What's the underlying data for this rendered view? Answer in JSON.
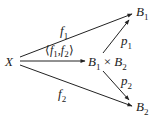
{
  "nodes": {
    "X": "X",
    "product": {
      "left": "B",
      "left_sub": "1",
      "op": "×",
      "right": "B",
      "right_sub": "2"
    },
    "B1": {
      "base": "B",
      "sub": "1"
    },
    "B2": {
      "base": "B",
      "sub": "2"
    }
  },
  "arrows": {
    "f1": {
      "base": "f",
      "sub": "1"
    },
    "f2": {
      "base": "f",
      "sub": "2"
    },
    "pair": {
      "open": "⟨",
      "a": "f",
      "a_sub": "1",
      "sep": ",",
      "b": "f",
      "b_sub": "2",
      "close": "⟩"
    },
    "p1": {
      "base": "p",
      "sub": "1"
    },
    "p2": {
      "base": "p",
      "sub": "2"
    }
  }
}
